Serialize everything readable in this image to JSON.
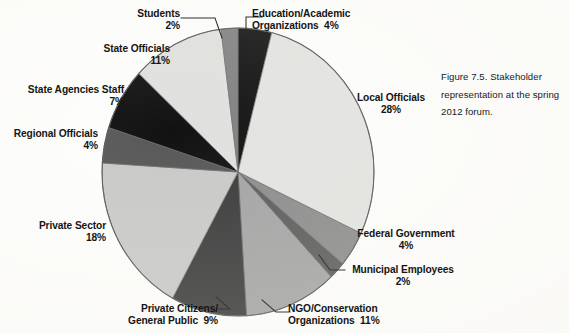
{
  "figure": {
    "caption": "Figure 7.5. Stakeholder representation at the spring 2012 forum."
  },
  "chart_data": {
    "type": "pie",
    "title": "",
    "xlabel": "",
    "ylabel": "",
    "units": "percent",
    "legend_position": "none",
    "grid": false,
    "labels": [
      "Education/Academic Organizations",
      "Local Officials",
      "Federal Government",
      "Municipal Employees",
      "NGO/Conservation Organizations",
      "Private Citizens/General Public",
      "Private Sector",
      "Regional Officials",
      "State Agencies Staff",
      "State Officials",
      "Students"
    ],
    "values": [
      4,
      28,
      4,
      2,
      11,
      9,
      18,
      4,
      7,
      11,
      2
    ],
    "colors": [
      "#141414",
      "#e3e3e1",
      "#8c8c8c",
      "#5c5c5c",
      "#a4a4a4",
      "#3b3b3b",
      "#c9c9c7",
      "#585858",
      "#121212",
      "#e0e0de",
      "#828282"
    ],
    "slice_order_clockwise_from_12": [
      "Education/Academic Organizations",
      "Local Officials",
      "Federal Government",
      "Municipal Employees",
      "NGO/Conservation Organizations",
      "Private Citizens/General Public",
      "Private Sector",
      "Regional Officials",
      "State Agencies Staff",
      "State Officials",
      "Students"
    ]
  },
  "slices": {
    "education": {
      "name_line1": "Education/Academic",
      "name_line2": "Organizations",
      "pct": "4%",
      "label_full": "Education/Academic Organizations  4%"
    },
    "local_officials": {
      "name": "Local Officials",
      "pct": "28%"
    },
    "federal_government": {
      "name": "Federal Government",
      "pct": "4%"
    },
    "municipal_employees": {
      "name": "Municipal Employees",
      "pct": "2%"
    },
    "ngo": {
      "name_line1": "NGO/Conservation",
      "name_line2": "Organizations",
      "pct": "11%"
    },
    "private_citizens": {
      "name_line1": "Private Citizens/",
      "name_line2": "General Public",
      "pct": "9%"
    },
    "private_sector": {
      "name": "Private Sector",
      "pct": "18%"
    },
    "regional_officials": {
      "name": "Regional Officials",
      "pct": "4%"
    },
    "state_agencies_staff": {
      "name": "State Agencies Staff",
      "pct": "7%"
    },
    "state_officials": {
      "name": "State Officials",
      "pct": "11%"
    },
    "students": {
      "name": "Students",
      "pct": "2%"
    }
  }
}
